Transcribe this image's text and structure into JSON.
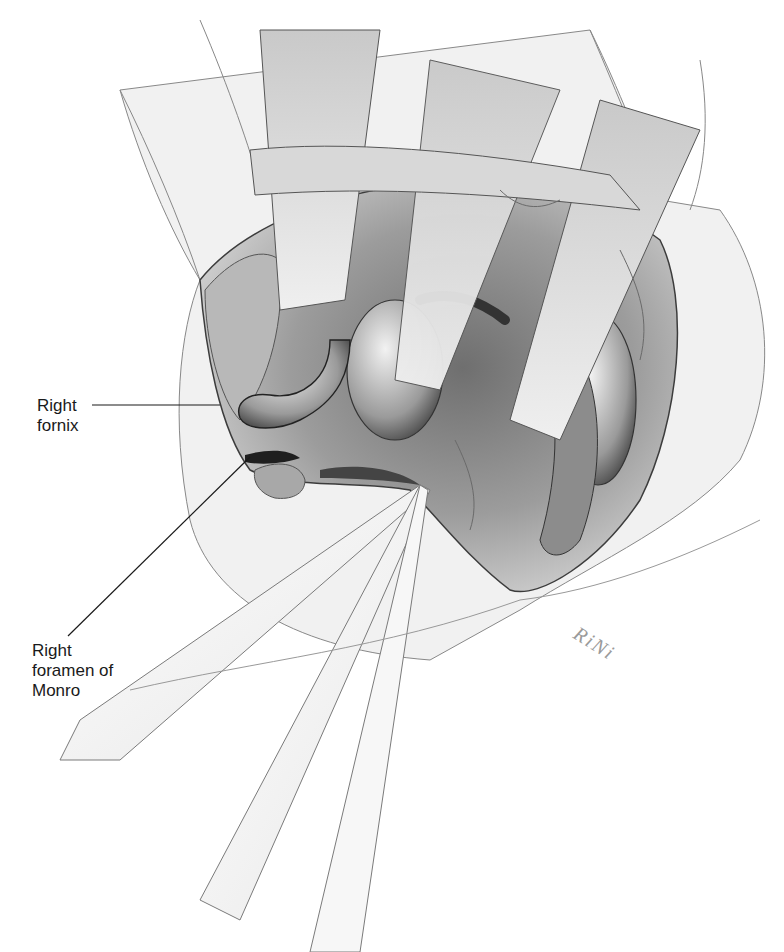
{
  "figure": {
    "labels": [
      {
        "id": "right-fornix",
        "text": "Right\nfornix"
      },
      {
        "id": "right-foramen-of-monro",
        "text": "Right\nforamen of\nMonro"
      }
    ],
    "signature": "RiNi",
    "colors": {
      "ink": "#1a1a1a",
      "shadow_dark": "#3c3c3c",
      "shadow_mid": "#8a8a8a",
      "tone_light": "#d4d4d4",
      "paper": "#ffffff"
    }
  }
}
